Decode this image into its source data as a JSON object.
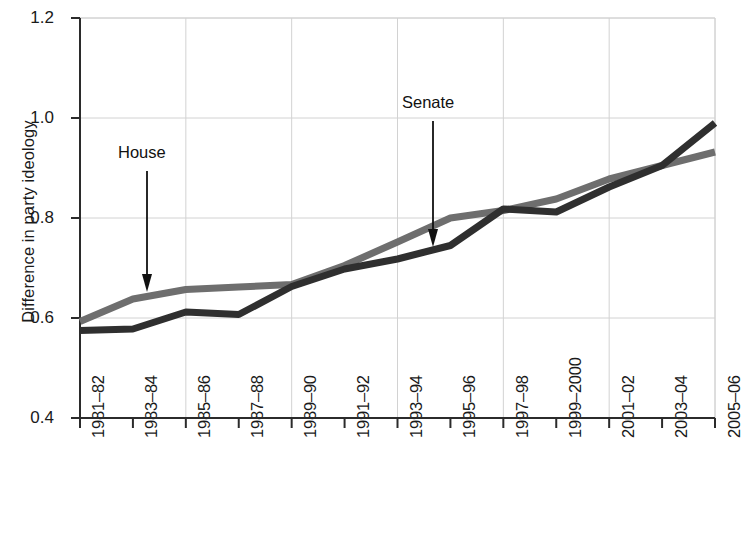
{
  "chart_data": {
    "type": "line",
    "title": "",
    "xlabel": "",
    "ylabel": "Difference in party ideology",
    "categories": [
      "1981–82",
      "1983–84",
      "1985–86",
      "1987–88",
      "1989–90",
      "1991–92",
      "1993–94",
      "1995–96",
      "1997–98",
      "1999–2000",
      "2001–02",
      "2003–04",
      "2005–06"
    ],
    "ylim": [
      0.4,
      1.2
    ],
    "yticks": [
      "0.4",
      "0.6",
      "0.8",
      "1.0",
      "1.2"
    ],
    "ytick_values": [
      0.4,
      0.6,
      0.8,
      1.0,
      1.2
    ],
    "grid": true,
    "legend_position": "inline-annotations",
    "series": [
      {
        "name": "House",
        "color": "#6e6e6e",
        "values": [
          0.593,
          0.638,
          0.657,
          0.662,
          0.667,
          0.705,
          0.752,
          0.8,
          0.815,
          0.838,
          0.878,
          0.905,
          0.932
        ]
      },
      {
        "name": "Senate",
        "color": "#2f2f2f",
        "values": [
          0.575,
          0.578,
          0.612,
          0.607,
          0.663,
          0.698,
          0.718,
          0.745,
          0.818,
          0.812,
          0.862,
          0.905,
          0.99
        ]
      }
    ],
    "annotations": [
      {
        "text": "House",
        "series": "House",
        "category": "1983–84"
      },
      {
        "text": "Senate",
        "series": "Senate",
        "category": "1995–96"
      }
    ]
  }
}
